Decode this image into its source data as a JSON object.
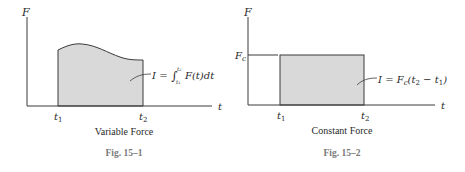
{
  "figures": [
    {
      "id": "fig-15-1",
      "y_axis_label": "F",
      "x_axis_label": "t",
      "t1_label": "t",
      "t1_sub": "1",
      "t2_label": "t",
      "t2_sub": "2",
      "equation": {
        "lhs": "I = ",
        "integral": "∫",
        "upper": "t₂",
        "lower": "t₁",
        "body": "F(t)dt"
      },
      "caption": "Variable Force",
      "figure_number": "Fig. 15–1"
    },
    {
      "id": "fig-15-2",
      "y_axis_label": "F",
      "fc_label": "F",
      "fc_sub": "c",
      "x_axis_label": "t",
      "t1_label": "t",
      "t1_sub": "1",
      "t2_label": "t",
      "t2_sub": "2",
      "equation": {
        "lhs": "I = F",
        "sub_c": "c",
        "open": "(t",
        "sub_2": "2",
        "minus": " − t",
        "sub_1": "1",
        "close": ")"
      },
      "caption": "Constant Force",
      "figure_number": "Fig. 15–2"
    }
  ],
  "colors": {
    "axis": "#3a3a3a",
    "fill": "#d9d9d9",
    "figure_number": "#7a7a7a"
  }
}
